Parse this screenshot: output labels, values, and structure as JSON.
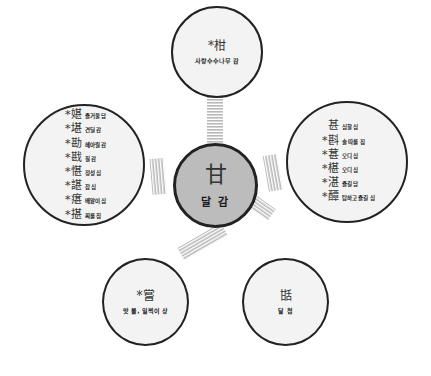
{
  "center": {
    "hanja": "甘",
    "meaning": "달 감"
  },
  "top": {
    "hanja": "*柑",
    "meaning": "사랑수수나무 감"
  },
  "left": {
    "items": [
      {
        "hanja": "*媅",
        "meaning": "즐거울 담"
      },
      {
        "hanja": "*堪",
        "meaning": "견딜 감"
      },
      {
        "hanja": "*勘",
        "meaning": "헤아릴 감"
      },
      {
        "hanja": "*戡",
        "meaning": "칠 감"
      },
      {
        "hanja": "*愖",
        "meaning": "정성 심"
      },
      {
        "hanja": "*諶",
        "meaning": "참 심"
      },
      {
        "hanja": "*瘎",
        "meaning": "배앓이 심"
      },
      {
        "hanja": "*揕",
        "meaning": "찌를 침"
      }
    ]
  },
  "right": {
    "items": [
      {
        "hanja": "甚",
        "meaning": "심할 심"
      },
      {
        "hanja": "*斟",
        "meaning": "술 따를 짐"
      },
      {
        "hanja": "*葚",
        "meaning": "오디 심"
      },
      {
        "hanja": "*椹",
        "meaning": "오디 심"
      },
      {
        "hanja": "*湛",
        "meaning": "즐길 담"
      },
      {
        "hanja": "*醰",
        "meaning": "탐하고 즐길 심"
      }
    ]
  },
  "bottom_left": {
    "hanja": "*嘗",
    "meaning": "맛 볼, 일찍이 상"
  },
  "bottom_right": {
    "hanja": "甛",
    "meaning": "달 첨"
  },
  "colors": {
    "center_fill": "#bcbcbc",
    "node_fill": "#f3f3f3",
    "border": "#222222",
    "connector": "#c8c8c8"
  }
}
